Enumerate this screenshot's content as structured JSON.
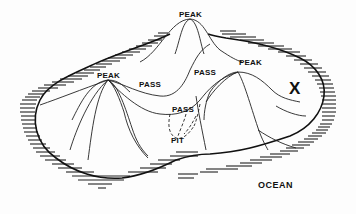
{
  "diagram": {
    "type": "topographic-island-diagram",
    "colors": {
      "ink": "#111111",
      "background": "#fdfdfd"
    },
    "labels": {
      "peak_top": "PEAK",
      "peak_left": "PEAK",
      "peak_right": "PEAK",
      "pass_left": "PASS",
      "pass_upper_right": "PASS",
      "pass_center": "PASS",
      "pit": "PIT",
      "x_mark": "X",
      "ocean": "OCEAN"
    }
  }
}
